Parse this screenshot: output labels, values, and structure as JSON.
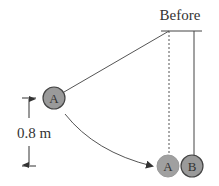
{
  "diagram": {
    "title": "Before",
    "dimension_label": "0.8 m",
    "ball_a_label": "A",
    "ball_a_final_label": "A",
    "ball_b_label": "B",
    "colors": {
      "ball_fill": "#9a9a9a",
      "ball_stroke": "#444444",
      "line": "#555555",
      "text": "#333333"
    }
  }
}
